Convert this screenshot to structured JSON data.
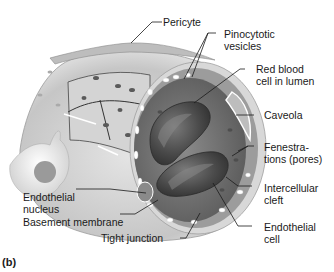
{
  "figure": {
    "panel_label": "(b)",
    "labels": {
      "pericyte": "Pericyte",
      "pinocytotic_vesicles": "Pinocytotic\nvesicles",
      "red_blood_cell": "Red blood\ncell in lumen",
      "caveola": "Caveola",
      "fenestrations": "Fenestra-\ntions (pores)",
      "intercellular_cleft": "Intercellular\ncleft",
      "endothelial_cell": "Endothelial\ncell",
      "endothelial_nucleus": "Endothelial\nnucleus",
      "basement_membrane": "Basement membrane",
      "tight_junction": "Tight junction"
    },
    "colors": {
      "background": "#ffffff",
      "vessel_wall": "#c8c8c8",
      "lumen": "#6e6e6e",
      "red_blood_cell": "#4a4a4a",
      "leader_line": "#1a1a1a"
    }
  }
}
